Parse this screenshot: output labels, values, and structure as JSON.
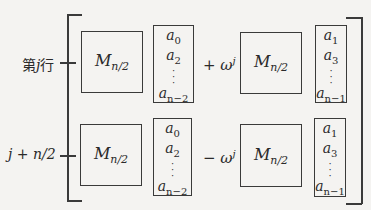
{
  "diagram": {
    "row_labels": {
      "top": {
        "prefix": "第",
        "var": "j",
        "suffix": "行"
      },
      "bottom": "j + n/2"
    },
    "blocks": {
      "matrix_main": "M",
      "matrix_sub": "n/2"
    },
    "operators": {
      "top": "+ ω",
      "bottom": "− ω",
      "exponent": "j"
    },
    "vectors": {
      "even": {
        "entries": [
          {
            "base": "a",
            "sub": "0"
          },
          {
            "base": "a",
            "sub": "2"
          },
          {
            "base": "a",
            "sub": "n−2"
          }
        ]
      },
      "odd": {
        "entries": [
          {
            "base": "a",
            "sub": "1"
          },
          {
            "base": "a",
            "sub": "3"
          },
          {
            "base": "a",
            "sub": "n−1"
          }
        ]
      }
    },
    "colors": {
      "stroke": "#3a3a3a",
      "background": "#f4f3f1",
      "text": "#2a2a2a"
    }
  }
}
